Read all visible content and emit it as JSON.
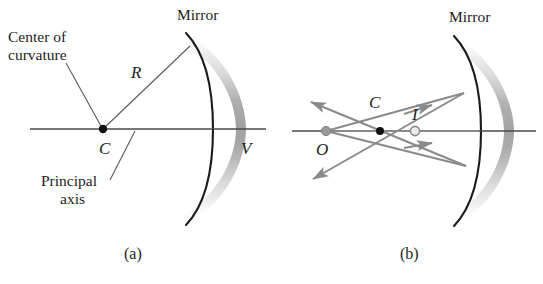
{
  "figure": {
    "background_color": "#ffffff",
    "width": 543,
    "height": 284
  },
  "colors": {
    "ink": "#1d1d1d",
    "axis": "#4a4a4a",
    "mirror_arc": "#1a1a1a",
    "mirror_shade": "#b4b4b4",
    "ray": "#8a8a8a",
    "leader": "#555555",
    "point_filled": "#111111",
    "point_object": "#9a9a9a",
    "point_image_fill": "#e8e8e8"
  },
  "panel_a": {
    "caption": "(a)",
    "labels": {
      "mirror": "Mirror",
      "center_of_curvature_line1": "Center of",
      "center_of_curvature_line2": "curvature",
      "radius": "R",
      "center_point": "C",
      "vertex": "V",
      "principal_axis_line1": "Principal",
      "principal_axis_line2": "axis"
    },
    "geometry": {
      "center_of_curvature_point": [
        103,
        129
      ],
      "vertex_point": [
        213,
        129
      ],
      "axis_y": 129,
      "axis_x_start": 30,
      "axis_x_end": 266,
      "radius_length_px": 119
    }
  },
  "panel_b": {
    "caption": "(b)",
    "labels": {
      "mirror": "Mirror",
      "object": "O",
      "center_point": "C",
      "image": "I"
    },
    "geometry": {
      "object_point": [
        326,
        131
      ],
      "center_of_curvature_point": [
        380,
        131
      ],
      "image_point": [
        415,
        131
      ],
      "axis_y": 131,
      "axis_x_start": 292,
      "axis_x_end": 536,
      "ray_count": 3
    }
  }
}
